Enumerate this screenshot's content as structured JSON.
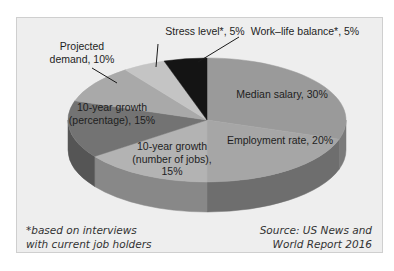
{
  "chart_data": {
    "type": "pie",
    "style": "3d",
    "title": "",
    "categories": [
      "Median salary",
      "Employment rate",
      "10-year growth (number of jobs)",
      "10-year growth (percentage)",
      "Projected demand",
      "Stress level*",
      "Work–life balance*"
    ],
    "values": [
      30,
      20,
      15,
      15,
      10,
      5,
      5
    ],
    "unit": "%",
    "colors": [
      "#9a9a9a",
      "#a6a6a6",
      "#b3b3b3",
      "#737373",
      "#a9a9a9",
      "#c4c4c4",
      "#141414"
    ],
    "side_colors": [
      "#7a7a7a",
      "#6e6e6e",
      "#888888",
      "#555555",
      "#8a8a8a",
      "#9a9a9a",
      "#0a0a0a"
    ],
    "labels": [
      {
        "lines": [
          "Median salary, 30%"
        ]
      },
      {
        "lines": [
          "Employment rate, 20%"
        ]
      },
      {
        "lines": [
          "10-year growth",
          "(number of jobs),",
          "15%"
        ]
      },
      {
        "lines": [
          "10-year growth",
          "(percentage), 15%"
        ]
      },
      {
        "lines": [
          "Projected",
          "demand, 10%"
        ]
      },
      {
        "lines": [
          "Stress level*, 5%"
        ]
      },
      {
        "lines": [
          "Work–life balance*, 5%"
        ]
      }
    ],
    "start_angle_deg": 0,
    "direction": "clockwise",
    "legend": "none"
  },
  "notes": {
    "footnote_line1": "*based on interviews",
    "footnote_line2": "with current job holders",
    "source_line1": "Source: US News and",
    "source_line2": "World Report 2016"
  }
}
